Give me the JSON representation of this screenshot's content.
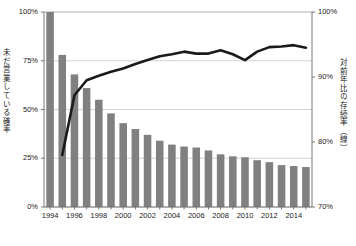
{
  "chart_data": {
    "type": "bar",
    "title": "",
    "subtitle": "",
    "xlabel": "",
    "ylabel": "未だ営業している確率",
    "y2label": "対前年比の存続率（線）",
    "grid": true,
    "legend_position": "none",
    "axis_left": {
      "label": "未だ営業している確率",
      "ticks": [
        "0%",
        "25%",
        "50%",
        "75%",
        "100%"
      ],
      "tick_values": [
        0,
        25,
        50,
        75,
        100
      ],
      "ylim": [
        0,
        100
      ]
    },
    "axis_right": {
      "label": "対前年比の存続率（線）",
      "ticks": [
        "70%",
        "80%",
        "90%",
        "100%"
      ],
      "tick_values": [
        70,
        80,
        90,
        100
      ],
      "ylim": [
        70,
        100
      ]
    },
    "categories": [
      "1994",
      "1995",
      "1996",
      "1997",
      "1998",
      "1999",
      "2000",
      "2001",
      "2002",
      "2003",
      "2004",
      "2005",
      "2006",
      "2007",
      "2008",
      "2009",
      "2010",
      "2011",
      "2012",
      "2013",
      "2014",
      "2015"
    ],
    "xtick_labels": [
      "1994",
      "1996",
      "1998",
      "2000",
      "2002",
      "2004",
      "2006",
      "2008",
      "2010",
      "2012",
      "2014"
    ],
    "xtick_categories": [
      "1994",
      "1996",
      "1998",
      "2000",
      "2002",
      "2004",
      "2006",
      "2008",
      "2010",
      "2012",
      "2014"
    ],
    "series": [
      {
        "name": "未だ営業している確率",
        "type": "bar",
        "axis": "left",
        "color": "#808080",
        "values": [
          100,
          78,
          68,
          61,
          55,
          48,
          43,
          40,
          37,
          34,
          32,
          31,
          30.5,
          29,
          27,
          26,
          25.5,
          24,
          23,
          21.5,
          21,
          20.5
        ]
      },
      {
        "name": "対前年比の存続率（線）",
        "type": "line",
        "axis": "right",
        "color": "#1a1a1a",
        "start_category": "1995",
        "values": [
          78.0,
          87.2,
          89.5,
          90.2,
          90.8,
          91.3,
          92.0,
          92.6,
          93.2,
          93.5,
          93.9,
          93.6,
          93.6,
          94.1,
          93.5,
          92.6,
          93.9,
          94.6,
          94.7,
          94.9,
          94.5,
          95.3
        ]
      }
    ]
  },
  "plot_geometry": {
    "left": 44,
    "right": 312,
    "top": 12,
    "bottom": 207
  }
}
